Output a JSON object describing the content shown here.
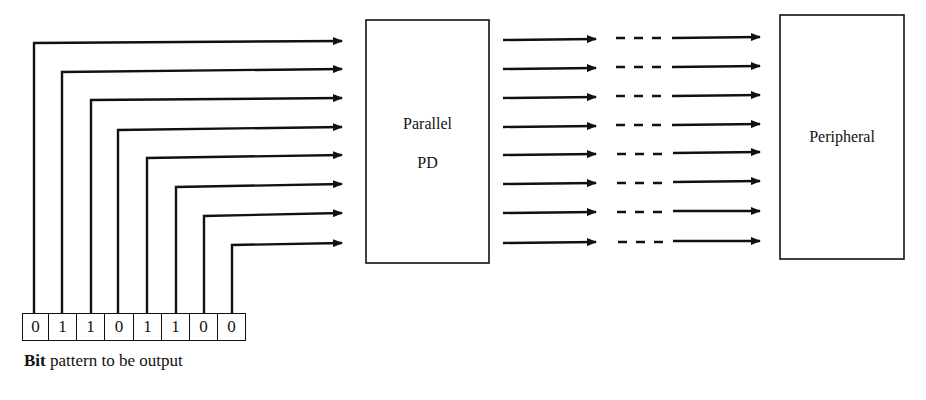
{
  "diagram": {
    "type": "parallel-output-block-diagram",
    "stroke_color": "#111111",
    "background": "#ffffff",
    "pd_box": {
      "line1": "Parallel",
      "line2": "PD"
    },
    "peripheral_box": {
      "label": "Peripheral"
    },
    "bits": [
      "0",
      "1",
      "1",
      "0",
      "1",
      "1",
      "0",
      "0"
    ],
    "caption": {
      "bold": "Bit",
      "rest": " pattern to be output"
    },
    "line_count": 8
  }
}
